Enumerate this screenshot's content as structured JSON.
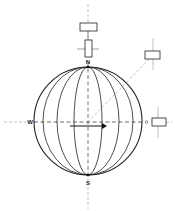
{
  "diagram": {
    "labels": {
      "north": "N",
      "south": "S",
      "west": "W",
      "east": "O"
    },
    "meridian_count": 7,
    "elements": [
      "globe-outline",
      "meridian-lines",
      "vertical-axis-dashed",
      "horizontal-axis-dashed",
      "diagonal-axis-dashed",
      "eastward-arrow",
      "top-horizontal-box",
      "top-vertical-box",
      "upper-right-box",
      "right-box"
    ],
    "colors": {
      "stroke": "#222222",
      "dashed": "#888888",
      "background": "#ffffff"
    }
  }
}
